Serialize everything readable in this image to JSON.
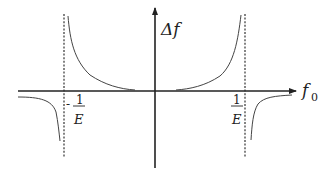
{
  "diagram": {
    "axes": {
      "x_label": "f",
      "x_label_sub": "0",
      "y_label": "Δf"
    },
    "asymptotes": [
      {
        "position": "-1/E",
        "minus": "-",
        "numerator": "1",
        "denominator": "E"
      },
      {
        "position": "1/E",
        "minus": "",
        "numerator": "1",
        "denominator": "E"
      }
    ],
    "colors": {
      "axis": "#222222",
      "curve": "#444444",
      "asymptote": "#333333",
      "background": "#ffffff"
    }
  }
}
